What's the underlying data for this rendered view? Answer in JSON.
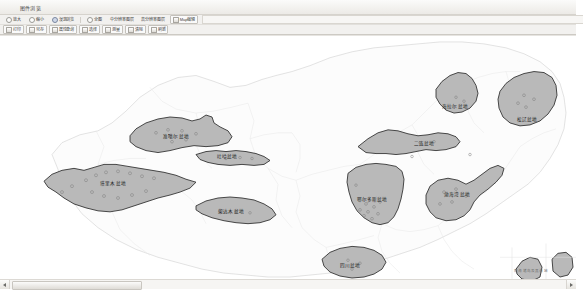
{
  "window": {
    "title": "图件浏览"
  },
  "toolbar_row1": {
    "items": [
      {
        "label": "放大",
        "icon": "zoom-in-icon",
        "type": "radio"
      },
      {
        "label": "缩小",
        "icon": "zoom-out-icon",
        "type": "radio"
      },
      {
        "label": "漫游浏览",
        "icon": "pan-icon",
        "type": "radio",
        "selected": true
      },
      {
        "label": "全图",
        "icon": "fit-extent-icon",
        "type": "radio"
      },
      {
        "label": "中分辨率图层",
        "icon": "layer-medium-icon",
        "type": "button"
      },
      {
        "label": "高分辨率图层",
        "icon": "layer-high-icon",
        "type": "button"
      },
      {
        "label": "Map编辑",
        "icon": "map-edit-icon",
        "type": "button"
      }
    ]
  },
  "toolbar_row2": {
    "items": [
      {
        "label": "打印",
        "icon": "print-icon"
      },
      {
        "label": "另存",
        "icon": "save-as-icon"
      },
      {
        "label": "属性查询",
        "icon": "attribute-query-icon"
      },
      {
        "label": "选择",
        "icon": "select-icon"
      },
      {
        "label": "测量",
        "icon": "measure-icon"
      },
      {
        "label": "清除",
        "icon": "clear-icon"
      },
      {
        "label": "刷新",
        "icon": "refresh-icon"
      }
    ]
  },
  "map": {
    "basins": [
      {
        "name": "准噶尔盆地",
        "x": 176,
        "y": 100
      },
      {
        "name": "吐哈盆地",
        "x": 227,
        "y": 120
      },
      {
        "name": "塔里木盆地",
        "x": 113,
        "y": 147
      },
      {
        "name": "柴达木盆地",
        "x": 231,
        "y": 175
      },
      {
        "name": "海拉尔盆地",
        "x": 455,
        "y": 70
      },
      {
        "name": "二连盆地",
        "x": 424,
        "y": 107
      },
      {
        "name": "松辽盆地",
        "x": 527,
        "y": 83
      },
      {
        "name": "鄂尔多斯盆地",
        "x": 372,
        "y": 163
      },
      {
        "name": "渤海湾盆地",
        "x": 457,
        "y": 158
      },
      {
        "name": "四川盆地",
        "x": 350,
        "y": 229
      }
    ],
    "sea_note": "南海诸岛及其海域",
    "colors": {
      "basin_fill": "#b9b9b9",
      "basin_stroke": "#2b2b2b",
      "province_stroke": "#e2e2e2",
      "country_stroke": "#cfcfcf",
      "canvas_bg": "#ffffff",
      "field_marker": "#8c8c8c"
    }
  },
  "scrollbar": {
    "left_arrow": "◀",
    "right_arrow": "▶"
  }
}
